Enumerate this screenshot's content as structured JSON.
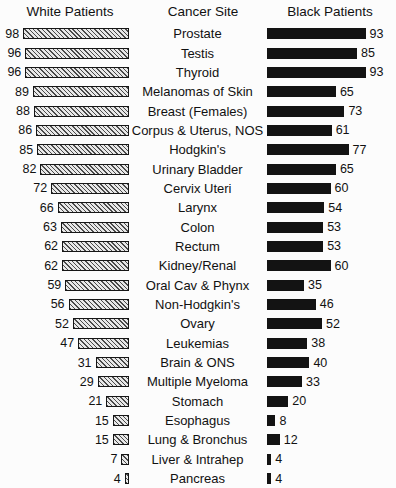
{
  "headers": {
    "left": "White Patients",
    "middle": "Cancer Site",
    "right": "Black Patients"
  },
  "chart_data": {
    "type": "bar",
    "title": "",
    "subtitle": "",
    "xlabel": "",
    "ylabel": "",
    "orientation": "horizontal",
    "layout": "paired-bidirectional",
    "grid": false,
    "legend_position": "column-headers",
    "xlim": [
      0,
      100
    ],
    "value_unit": "percent",
    "categories": [
      "Prostate",
      "Testis",
      "Thyroid",
      "Melanomas of Skin",
      "Breast (Females)",
      "Corpus & Uterus, NOS",
      "Hodgkin's",
      "Urinary Bladder",
      "Cervix Uteri",
      "Larynx",
      "Colon",
      "Rectum",
      "Kidney/Renal",
      "Oral Cav & Phynx",
      "Non-Hodgkin's",
      "Ovary",
      "Leukemias",
      "Brain & ONS",
      "Multiple Myeloma",
      "Stomach",
      "Esophagus",
      "Lung & Bronchus",
      "Liver & Intrahep",
      "Pancreas"
    ],
    "series": [
      {
        "name": "White Patients",
        "side": "left",
        "fill": "hatched",
        "color": "#d2d2d2",
        "values": [
          98,
          96,
          96,
          89,
          88,
          86,
          85,
          82,
          72,
          66,
          63,
          62,
          62,
          59,
          56,
          52,
          47,
          31,
          29,
          21,
          15,
          15,
          7,
          4
        ]
      },
      {
        "name": "Black Patients",
        "side": "right",
        "fill": "solid",
        "color": "#131313",
        "values": [
          93,
          85,
          93,
          65,
          73,
          61,
          77,
          65,
          60,
          54,
          53,
          53,
          60,
          35,
          46,
          52,
          38,
          40,
          33,
          20,
          8,
          12,
          4,
          4
        ]
      }
    ]
  },
  "colors": {
    "background": "#fcfcfc",
    "text": "#111111",
    "left_bar_fill": "#d2d2d2",
    "left_bar_hatch": "#4a4a4a",
    "left_bar_border": "#161616",
    "right_bar_fill": "#131313"
  }
}
